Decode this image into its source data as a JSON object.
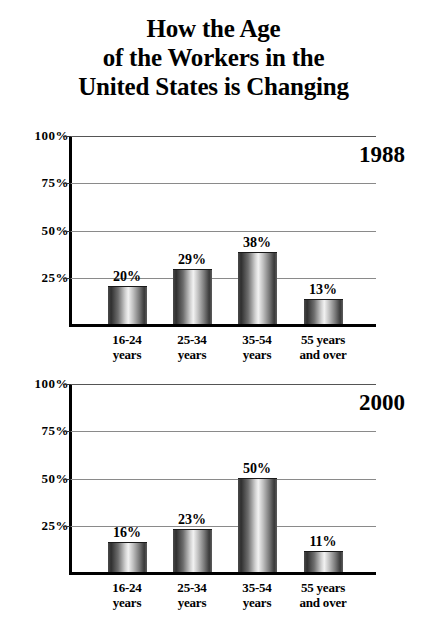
{
  "title": {
    "line1": "How the Age",
    "line2": "of the Workers in the",
    "line3": "United States is Changing"
  },
  "chart_data": [
    {
      "type": "bar",
      "title": "1988",
      "categories": [
        "16-24 years",
        "25-34 years",
        "35-54 years",
        "55 years and over"
      ],
      "category_lines": [
        [
          "16-24",
          "years"
        ],
        [
          "25-34",
          "years"
        ],
        [
          "35-54",
          "years"
        ],
        [
          "55 years",
          "and over"
        ]
      ],
      "values": [
        20,
        29,
        38,
        13
      ],
      "value_labels": [
        "20%",
        "29%",
        "38%",
        "13%"
      ],
      "ticks": [
        100,
        75,
        50,
        25
      ],
      "tick_labels": [
        "100%",
        "75%",
        "50%",
        "25%"
      ],
      "ylim": [
        0,
        100
      ],
      "xlabel": "",
      "ylabel": "",
      "grid": true,
      "legend": "none"
    },
    {
      "type": "bar",
      "title": "2000",
      "categories": [
        "16-24 years",
        "25-34 years",
        "35-54 years",
        "55 years and over"
      ],
      "category_lines": [
        [
          "16-24",
          "years"
        ],
        [
          "25-34",
          "years"
        ],
        [
          "35-54",
          "years"
        ],
        [
          "55 years",
          "and over"
        ]
      ],
      "values": [
        16,
        23,
        50,
        11
      ],
      "value_labels": [
        "16%",
        "23%",
        "50%",
        "11%"
      ],
      "ticks": [
        100,
        75,
        50,
        25
      ],
      "tick_labels": [
        "100%",
        "75%",
        "50%",
        "25%"
      ],
      "ylim": [
        0,
        100
      ],
      "xlabel": "",
      "ylabel": "",
      "grid": true,
      "legend": "none"
    }
  ],
  "colors": {
    "background": "#ffffff",
    "text": "#000000",
    "axis": "#000000",
    "gridline": "#8a8a8a",
    "bar_dark": "#2f2f2f",
    "bar_light": "#f2f2f2"
  }
}
